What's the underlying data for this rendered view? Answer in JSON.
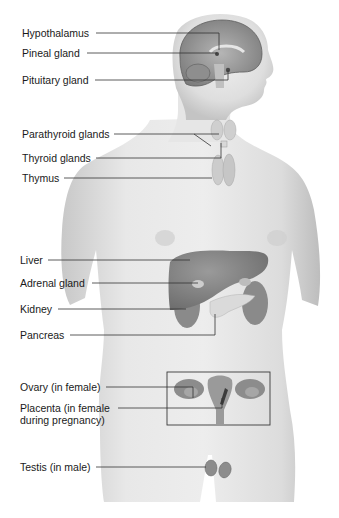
{
  "diagram": {
    "labels": [
      {
        "id": "hypothalamus",
        "text": "Hypothalamus"
      },
      {
        "id": "pineal-gland",
        "text": "Pineal gland"
      },
      {
        "id": "pituitary-gland",
        "text": "Pituitary gland"
      },
      {
        "id": "parathyroid-glands",
        "text": "Parathyroid glands"
      },
      {
        "id": "thyroid-glands",
        "text": "Thyroid glands"
      },
      {
        "id": "thymus",
        "text": "Thymus"
      },
      {
        "id": "liver",
        "text": "Liver"
      },
      {
        "id": "adrenal-gland",
        "text": "Adrenal gland"
      },
      {
        "id": "kidney",
        "text": "Kidney"
      },
      {
        "id": "pancreas",
        "text": "Pancreas"
      },
      {
        "id": "ovary",
        "text": "Ovary (in female)"
      },
      {
        "id": "placenta",
        "text": "Placenta (in female\nduring pregnancy)"
      },
      {
        "id": "testis",
        "text": "Testis (in male)"
      }
    ],
    "colors": {
      "skin": "#e2e2e2",
      "skin_shadow": "#b9b9b9",
      "organ": "#8a8a8a",
      "organ_dark": "#6e6e6e",
      "gland_light": "#cfcfcf",
      "leader_line": "#333333",
      "label_text": "#1a1a1a"
    }
  }
}
